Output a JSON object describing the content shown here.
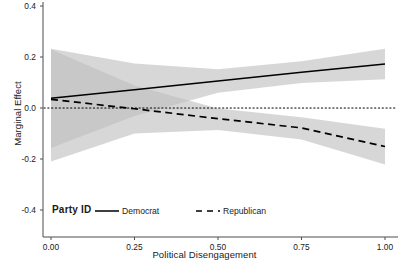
{
  "chart_data": {
    "type": "line",
    "title": "",
    "xlabel": "Political Disengagement",
    "ylabel": "Marginal Effect",
    "xlim": [
      0.0,
      1.0
    ],
    "ylim": [
      -0.4,
      0.4
    ],
    "xticks": [
      "0.00",
      "0.25",
      "0.50",
      "0.75",
      "1.00"
    ],
    "xtick_values": [
      0.0,
      0.25,
      0.5,
      0.75,
      1.0
    ],
    "yticks": [
      "0.4",
      "0.2",
      "0.0",
      "-0.2",
      "-0.4"
    ],
    "ytick_values": [
      0.4,
      0.2,
      0.0,
      -0.2,
      -0.4
    ],
    "grid": false,
    "reference_line": {
      "y": 0.0,
      "style": "dotted",
      "color": "#000000"
    },
    "legend": {
      "title": "Party ID",
      "position": "bottom-inside-left",
      "entries": [
        {
          "name": "Democrat",
          "style": "solid"
        },
        {
          "name": "Republican",
          "style": "dashed"
        }
      ]
    },
    "series": [
      {
        "name": "Democrat",
        "style": "solid",
        "color": "#000000",
        "x": [
          0.0,
          0.25,
          0.5,
          0.75,
          1.0
        ],
        "values": [
          0.038,
          0.072,
          0.106,
          0.14,
          0.173
        ],
        "ci_upper": [
          0.232,
          0.175,
          0.152,
          0.183,
          0.232
        ],
        "ci_lower": [
          -0.157,
          -0.031,
          0.06,
          0.098,
          0.113
        ],
        "ribbon_color": "#bfbfbf",
        "ribbon_alpha": 0.55
      },
      {
        "name": "Republican",
        "style": "dashed",
        "color": "#000000",
        "x": [
          0.0,
          0.25,
          0.5,
          0.75,
          1.0
        ],
        "values": [
          0.034,
          -0.003,
          -0.042,
          -0.078,
          -0.151
        ],
        "ci_upper": [
          0.229,
          0.088,
          -0.002,
          -0.036,
          -0.081
        ],
        "ci_lower": [
          -0.21,
          -0.1,
          -0.086,
          -0.124,
          -0.222
        ],
        "ribbon_color": "#bfbfbf",
        "ribbon_alpha": 0.55
      }
    ]
  },
  "colors": {
    "panel_background": "#ffffff",
    "axis_line": "#4d4d4d",
    "line": "#000000",
    "ribbon": "#bfbfbf"
  }
}
